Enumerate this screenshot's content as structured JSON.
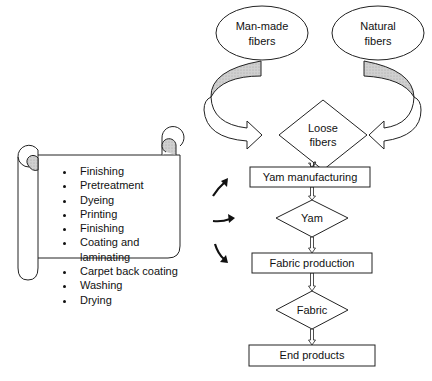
{
  "diagram": {
    "sources": [
      {
        "label_line1": "Man-made",
        "label_line2": "fibers"
      },
      {
        "label_line1": "Natural",
        "label_line2": "fibers"
      }
    ],
    "flow": {
      "loose_fibers": {
        "line1": "Loose",
        "line2": "fibers"
      },
      "yarn_manufacturing": "Yam manufacturing",
      "yarn": "Yam",
      "fabric_production": "Fabric production",
      "fabric": "Fabric",
      "end_products": "End products"
    },
    "scroll_list": [
      "Finishing",
      "Pretreatment",
      "Dyeing",
      "Printing",
      "Finishing",
      "Coating and laminating",
      "Carpet back coating",
      "Washing",
      "Drying"
    ],
    "colors": {
      "stroke": "#222222",
      "fill_shade": "#cccccc",
      "background": "#ffffff"
    }
  }
}
